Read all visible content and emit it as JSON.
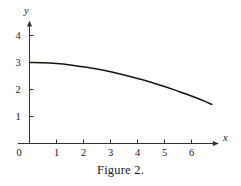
{
  "figure": {
    "caption": "Figure 2.",
    "background_color": "#ffffff",
    "ink_color": "#17150f",
    "axis_color": "#33302f"
  },
  "chart_data": {
    "type": "line",
    "title": "Figure 2.",
    "xlabel": "x",
    "ylabel": "y",
    "xlim": [
      0,
      7.0
    ],
    "ylim": [
      0,
      4.4
    ],
    "grid": false,
    "legend": false,
    "x_ticks": [
      0,
      1,
      2,
      3,
      4,
      5,
      6
    ],
    "x_tick_labels": [
      "0",
      "1",
      "2",
      "3",
      "4",
      "5",
      "6"
    ],
    "y_ticks": [
      1,
      2,
      3,
      4
    ],
    "y_tick_labels": [
      "1",
      "2",
      "3",
      "4"
    ],
    "axes_arrows": {
      "x": true,
      "y": true
    },
    "series": [
      {
        "name": "curve",
        "x": [
          0.0,
          0.5,
          1.0,
          1.5,
          2.0,
          2.5,
          3.0,
          3.5,
          4.0,
          4.5,
          5.0,
          5.5,
          6.0,
          6.5,
          6.75
        ],
        "y": [
          3.0,
          2.99,
          2.96,
          2.91,
          2.84,
          2.76,
          2.66,
          2.54,
          2.41,
          2.27,
          2.11,
          1.94,
          1.76,
          1.56,
          1.45
        ]
      }
    ]
  },
  "axis_labels": {
    "x": "x",
    "y": "y"
  },
  "x_tick_labels": {
    "t0": "0",
    "t1": "1",
    "t2": "2",
    "t3": "3",
    "t4": "4",
    "t5": "5",
    "t6": "6"
  },
  "y_tick_labels": {
    "t1": "1",
    "t2": "2",
    "t3": "3",
    "t4": "4"
  }
}
